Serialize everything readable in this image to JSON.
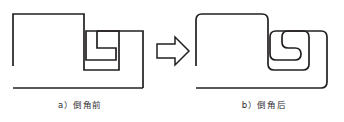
{
  "figure": {
    "background_color": "#ffffff",
    "stroke_color": "#231f20",
    "caption_color": "#2b2b2b",
    "stroke_width": 1.6,
    "panels": [
      {
        "id": "before",
        "caption": "a）倒角前",
        "label_prefix": "a",
        "corner_style": "sharp",
        "fillet_radius": 0
      },
      {
        "id": "after",
        "caption": "b）倒角后",
        "label_prefix": "b",
        "corner_style": "filleted",
        "fillet_radius": 6
      }
    ],
    "arrow": {
      "name": "transform-arrow",
      "direction": "right",
      "style": "outline-block-arrow",
      "stroke_color": "#231f20",
      "fill_color": "#ffffff"
    },
    "shape": {
      "description": "open polyline profile with rectangular notch",
      "before_points": [
        [
          12,
          14
        ],
        [
          128,
          14
        ],
        [
          128,
          28
        ],
        [
          72,
          28
        ],
        [
          72,
          48
        ],
        [
          110,
          48
        ],
        [
          110,
          68
        ],
        [
          72,
          68
        ],
        [
          72,
          88
        ],
        [
          12,
          88
        ]
      ],
      "after_points": [
        [
          12,
          14
        ],
        [
          128,
          14
        ],
        [
          128,
          28
        ],
        [
          72,
          28
        ],
        [
          72,
          48
        ],
        [
          110,
          48
        ],
        [
          110,
          68
        ],
        [
          72,
          68
        ],
        [
          72,
          88
        ],
        [
          12,
          88
        ]
      ],
      "open_segment_note": "left vertical edge terminates above bottom horizontal edge"
    }
  }
}
